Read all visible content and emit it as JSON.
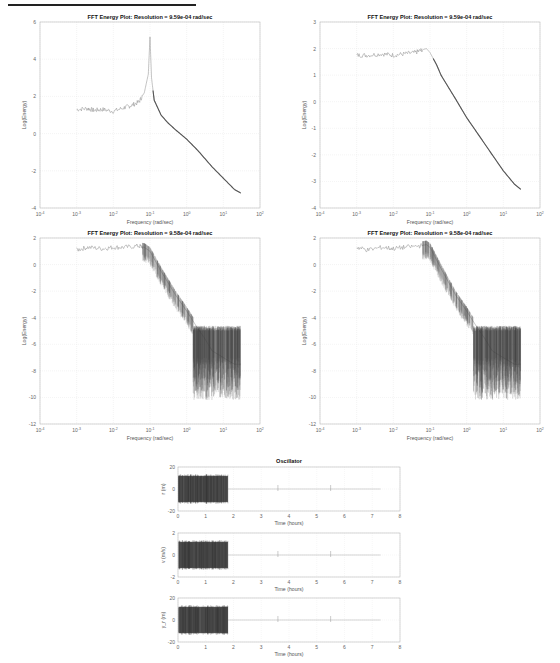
{
  "chart_data": [
    {
      "type": "line",
      "title": "FFT Energy Plot: Resolution =   9.59e-04 rad/sec",
      "xlabel": "Frequency (rad/sec)",
      "ylabel": "Log(Energy)",
      "xscale": "log",
      "xlim": [
        0.0001,
        100
      ],
      "ylim": [
        -4,
        6
      ],
      "xticks": [
        "10^-4",
        "10^-3",
        "10^-2",
        "10^-1",
        "10^0",
        "10^1",
        "10^2"
      ],
      "yticks": [
        6,
        4,
        2,
        0,
        -2,
        -4
      ],
      "grid": true,
      "series": [
        {
          "name": "spectrum 1",
          "x": [
            0.001,
            0.002,
            0.003,
            0.005,
            0.01,
            0.02,
            0.03,
            0.05,
            0.07,
            0.09,
            0.1,
            0.11,
            0.13,
            0.2,
            0.3,
            0.5,
            1,
            2,
            5,
            10,
            20,
            30
          ],
          "y": [
            1.3,
            1.35,
            1.25,
            1.3,
            1.2,
            1.4,
            1.5,
            1.7,
            2.2,
            3.2,
            5.2,
            3.0,
            1.8,
            1.0,
            0.6,
            0.2,
            -0.3,
            -0.9,
            -1.8,
            -2.4,
            -3.0,
            -3.2
          ]
        }
      ]
    },
    {
      "type": "line",
      "title": "FFT Energy Plot: Resolution =   9.59e-04 rad/sec",
      "xlabel": "Frequency (rad/sec)",
      "ylabel": "Log(Energy)",
      "xscale": "log",
      "xlim": [
        0.0001,
        100
      ],
      "ylim": [
        -4,
        3
      ],
      "xticks": [
        "10^-4",
        "10^-3",
        "10^-2",
        "10^-1",
        "10^0",
        "10^1",
        "10^2"
      ],
      "yticks": [
        3,
        2,
        1,
        0,
        -1,
        -2,
        -3,
        -4
      ],
      "grid": true,
      "series": [
        {
          "name": "spectrum 2",
          "x": [
            0.001,
            0.002,
            0.005,
            0.01,
            0.02,
            0.04,
            0.06,
            0.08,
            0.1,
            0.15,
            0.2,
            0.3,
            0.5,
            1,
            2,
            5,
            10,
            20,
            30
          ],
          "y": [
            1.75,
            1.75,
            1.8,
            1.75,
            1.8,
            1.85,
            1.95,
            2.0,
            1.85,
            1.4,
            1.0,
            0.6,
            0.1,
            -0.6,
            -1.2,
            -2.0,
            -2.6,
            -3.1,
            -3.3
          ]
        }
      ]
    },
    {
      "type": "line",
      "title": "FFT Energy Plot: Resolution =   9.58e-04 rad/sec",
      "xlabel": "Frequency (rad/sec)",
      "ylabel": "Log(Energy)",
      "xscale": "log",
      "xlim": [
        0.0001,
        100
      ],
      "ylim": [
        -12,
        2
      ],
      "xticks": [
        "10^-4",
        "10^-3",
        "10^-2",
        "10^-1",
        "10^0",
        "10^1",
        "10^2"
      ],
      "yticks": [
        2,
        0,
        -2,
        -4,
        -6,
        -8,
        -10,
        -12
      ],
      "grid": true,
      "series": [
        {
          "name": "spectrum 3",
          "x": [
            0.001,
            0.002,
            0.005,
            0.01,
            0.02,
            0.05,
            0.07,
            0.1,
            0.2,
            0.5,
            1,
            2,
            3,
            5,
            10,
            20,
            30
          ],
          "y": [
            1.1,
            1.3,
            1.2,
            1.3,
            1.3,
            1.4,
            1.3,
            1.0,
            -0.5,
            -2.3,
            -3.5,
            -4.8,
            -5.5,
            -6.5,
            -7,
            -7.5,
            -7.5
          ]
        }
      ]
    },
    {
      "type": "line",
      "title": "FFT Energy Plot: Resolution =   9.58e-04 rad/sec",
      "xlabel": "Frequency (rad/sec)",
      "ylabel": "Log(Energy)",
      "xscale": "log",
      "xlim": [
        0.0001,
        100
      ],
      "ylim": [
        -12,
        2
      ],
      "xticks": [
        "10^-4",
        "10^-3",
        "10^-2",
        "10^-1",
        "10^0",
        "10^1",
        "10^2"
      ],
      "yticks": [
        2,
        0,
        -2,
        -4,
        -6,
        -8,
        -10,
        -12
      ],
      "grid": true,
      "series": [
        {
          "name": "spectrum 4",
          "x": [
            0.001,
            0.002,
            0.005,
            0.01,
            0.02,
            0.05,
            0.08,
            0.1,
            0.2,
            0.5,
            1,
            2,
            3,
            5,
            10,
            20,
            30
          ],
          "y": [
            1.3,
            1.1,
            1.3,
            1.2,
            1.3,
            1.4,
            1.5,
            1.3,
            -0.3,
            -2.3,
            -3.5,
            -4.8,
            -5.5,
            -6.5,
            -7,
            -7.5,
            -7.5
          ]
        }
      ]
    },
    {
      "type": "line",
      "title": "Oscillator",
      "subplots": [
        {
          "ylabel": "r (m)",
          "xlabel": "Time (hours)",
          "ylim": [
            -20,
            20
          ],
          "yticks": [
            20,
            0,
            -20
          ],
          "xlim": [
            0,
            8
          ],
          "xticks": [
            0,
            1,
            2,
            3,
            4,
            5,
            6,
            7,
            8
          ],
          "description": "dense oscillation between ~-12 and ~12 from t=0 to t=1.8 hours, then ~0 with small spikes near t=3.6, 5.5"
        },
        {
          "ylabel": "v (m/s)",
          "xlabel": "Time (hours)",
          "ylim": [
            -2,
            2
          ],
          "yticks": [
            2,
            0,
            -2
          ],
          "xlim": [
            0,
            8
          ],
          "xticks": [
            0,
            1,
            2,
            3,
            4,
            5,
            6,
            7,
            8
          ],
          "description": "dense oscillation between ~-1.1 and ~1.1 from t=0 to t=1.8 hours, then ~0 with spikes near t=3.6, 5.5"
        },
        {
          "ylabel": "y_r (m)",
          "xlabel": "Time (hours)",
          "ylim": [
            -20,
            20
          ],
          "yticks": [
            20,
            0,
            -20
          ],
          "xlim": [
            0,
            8
          ],
          "xticks": [
            0,
            1,
            2,
            3,
            4,
            5,
            6,
            7,
            8
          ],
          "description": "dense oscillation between ~-12 and ~12 from t=0 to t=1.8 hours, then ~0 with small spikes near t=3.6, 5.5"
        }
      ]
    }
  ],
  "plots": {
    "p1": {
      "title": "FFT Energy Plot: Resolution =   9.59e-04 rad/sec",
      "xlabel": "Frequency (rad/sec)",
      "ylabel": "Log(Energy)",
      "yticks": [
        "6",
        "4",
        "2",
        "0",
        "-2",
        "-4"
      ]
    },
    "p2": {
      "title": "FFT Energy Plot: Resolution =   9.59e-04 rad/sec",
      "xlabel": "Frequency (rad/sec)",
      "ylabel": "Log(Energy)",
      "yticks": [
        "3",
        "2",
        "1",
        "0",
        "-1",
        "-2",
        "-3",
        "-4"
      ]
    },
    "p3": {
      "title": "FFT Energy Plot: Resolution =   9.58e-04 rad/sec",
      "xlabel": "Frequency (rad/sec)",
      "ylabel": "Log(Energy)",
      "yticks": [
        "2",
        "0",
        "-2",
        "-4",
        "-6",
        "-8",
        "-10",
        "-12"
      ]
    },
    "p4": {
      "title": "FFT Energy Plot: Resolution =   9.58e-04 rad/sec",
      "xlabel": "Frequency (rad/sec)",
      "ylabel": "Log(Energy)",
      "yticks": [
        "2",
        "0",
        "-2",
        "-4",
        "-6",
        "-8",
        "-10",
        "-12"
      ]
    },
    "xticks_base": "10",
    "xticks_exp": [
      "-4",
      "-3",
      "-2",
      "-1",
      "0",
      "1",
      "2"
    ],
    "osc": {
      "title": "Oscillator",
      "xlabel": "Time (hours)",
      "xticks": [
        "0",
        "1",
        "2",
        "3",
        "4",
        "5",
        "6",
        "7",
        "8"
      ],
      "s1": {
        "ylabel": "r (m)",
        "yticks": [
          "20",
          "0",
          "-20"
        ]
      },
      "s2": {
        "ylabel": "v (m/s)",
        "yticks": [
          "2",
          "0",
          "-2"
        ]
      },
      "s3": {
        "ylabel": "y_r (m)",
        "yticks": [
          "20",
          "0",
          "-20"
        ]
      }
    }
  }
}
